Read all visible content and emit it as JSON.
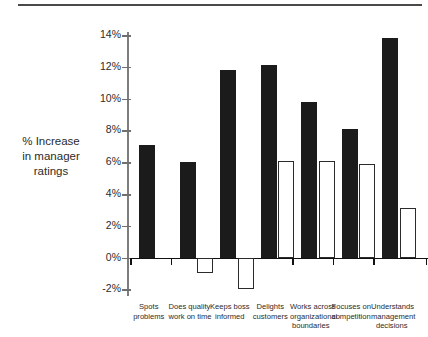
{
  "chart_data": {
    "type": "bar",
    "title": "",
    "xlabel": "",
    "ylabel": "% Increase in manager ratings",
    "ylabel_lines": [
      "% Increase",
      "in manager",
      "ratings"
    ],
    "categories": [
      "Spots problems",
      "Does quality work on time",
      "Keeps boss informed",
      "Delights customers",
      "Works across organizational boundaries",
      "Focuses on competition",
      "Understands management decisions"
    ],
    "category_lines": [
      [
        "Spots",
        "problems"
      ],
      [
        "Does quality",
        "work on time"
      ],
      [
        "Keeps boss",
        "informed"
      ],
      [
        "Delights",
        "customers"
      ],
      [
        "Works across",
        "organizational",
        "boundaries"
      ],
      [
        "Focuses on",
        "competition"
      ],
      [
        "Understands",
        "management",
        "decisions"
      ]
    ],
    "series": [
      {
        "name": "black",
        "color": "#1b1b1b",
        "values": [
          7.1,
          6.0,
          11.8,
          12.1,
          9.8,
          8.1,
          13.8
        ]
      },
      {
        "name": "white",
        "color": "#ffffff",
        "values": [
          null,
          -1.0,
          -2.0,
          6.1,
          6.1,
          5.9,
          3.1
        ]
      }
    ],
    "ylim": [
      -2,
      14
    ],
    "yticks": [
      14,
      12,
      10,
      8,
      6,
      4,
      2,
      0,
      -2
    ],
    "ytick_labels": [
      "14%",
      "12%",
      "10%",
      "8%",
      "6%",
      "4%",
      "2%",
      "0%",
      "-2%"
    ],
    "grid": false,
    "legend": "none",
    "baseline_value": 0
  },
  "decorations": {
    "top_rule": "horizontal-rule"
  }
}
